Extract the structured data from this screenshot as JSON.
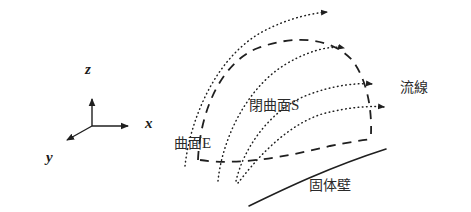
{
  "figure": {
    "title": "",
    "background_color": "#ffffff",
    "line_color": "#1f1f1f",
    "width": 471,
    "height": 212
  },
  "axes": {
    "origin": {
      "x": 92,
      "y": 126
    },
    "items": [
      {
        "id": "z",
        "label": "z",
        "tip": {
          "x": 92,
          "y": 94
        },
        "label_pos": {
          "x": 85,
          "y": 62
        }
      },
      {
        "id": "x",
        "label": "x",
        "tip": {
          "x": 133,
          "y": 126
        },
        "label_pos": {
          "x": 145,
          "y": 116
        }
      },
      {
        "id": "y",
        "label": "y",
        "tip": {
          "x": 62,
          "y": 143
        },
        "label_pos": {
          "x": 46,
          "y": 150
        }
      }
    ]
  },
  "labels": {
    "streamline": "流線",
    "closed_surface": "閉曲面 S",
    "closed_surface_name": "閉曲面",
    "closed_surface_symbol": "S",
    "surface_e": "曲面 E",
    "surface_e_name": "曲面",
    "surface_e_symbol": "E",
    "solid_wall": "固体壁"
  },
  "legend_positions": {
    "streamline": {
      "x": 400,
      "y": 80
    },
    "closed_surface": {
      "x": 249,
      "y": 98
    },
    "surface_e": {
      "x": 174,
      "y": 136
    },
    "solid_wall": {
      "x": 309,
      "y": 178
    }
  },
  "curves": {
    "streamlines": [
      {
        "id": "streamline-1",
        "style": "dotted",
        "path": "M 185 166 C 190 120, 215 58, 262 32 C 290 17, 315 13, 327 12",
        "arrow_at": {
          "x": 333,
          "y": 12
        },
        "arrow_angle": -7
      },
      {
        "id": "streamline-2",
        "style": "dotted",
        "path": "M 218 181 C 222 140, 246 88, 286 64 C 315 47, 335 46, 344 48",
        "arrow_at": {
          "x": 350,
          "y": 50
        },
        "arrow_angle": 12
      },
      {
        "id": "streamline-3",
        "style": "dotted",
        "path": "M 236 181 C 243 150, 268 112, 305 96 C 335 84, 360 83, 372 84",
        "arrow_at": {
          "x": 378,
          "y": 85
        },
        "arrow_angle": 5
      },
      {
        "id": "streamline-4",
        "style": "dotted",
        "path": "M 238 183 C 252 165, 282 127, 322 114 C 352 106, 374 106, 384 107",
        "arrow_at": {
          "x": 390,
          "y": 108
        },
        "arrow_angle": 4
      }
    ],
    "closed_surface_s": {
      "id": "closed-surface-s",
      "style": "dashed",
      "outline": "M 198 160 C 200 110, 222 62, 258 48 C 296 34, 332 38, 352 60 C 366 78, 372 106, 371 134"
    },
    "surface_e": {
      "id": "surface-e",
      "style": "dashed",
      "outline": "M 200 160 C 238 166, 290 156, 330 146 C 350 142, 364 140, 372 139"
    },
    "solid_wall": {
      "id": "solid-wall",
      "style": "solid",
      "outline": "M 249 206 C 286 188, 330 167, 386 149"
    }
  }
}
